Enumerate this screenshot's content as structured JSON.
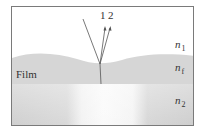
{
  "diagram": {
    "type": "thin-film-interference",
    "rays": [
      {
        "id": "incident",
        "label": ""
      },
      {
        "id": "ray-1",
        "label": "1"
      },
      {
        "id": "ray-2",
        "label": "2"
      }
    ],
    "layers": [
      {
        "id": "medium-top",
        "symbol": "n",
        "subscript": "1"
      },
      {
        "id": "film",
        "name": "Film",
        "symbol": "n",
        "subscript": "f"
      },
      {
        "id": "substrate",
        "symbol": "n",
        "subscript": "2"
      }
    ],
    "colors": {
      "film": "#d6d6d6",
      "substrate": "#d2d2d2",
      "highlight": "#f6f6f6",
      "ray": "#555555",
      "border": "#7a7a7a"
    }
  }
}
